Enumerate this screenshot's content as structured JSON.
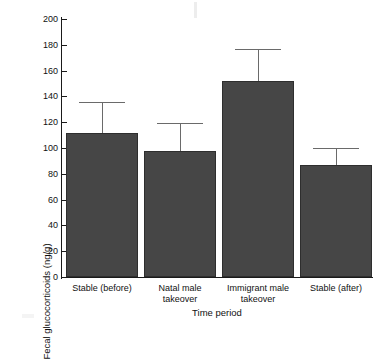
{
  "chart_data": {
    "type": "bar",
    "title": "",
    "xlabel": "Time period",
    "ylabel": "Fecal glucocorticoids (ng/g)",
    "categories": [
      "Stable (before)",
      "Natal male takeover",
      "Immigrant male takeover",
      "Stable (after)"
    ],
    "category_lines": [
      [
        "Stable (before)"
      ],
      [
        "Natal male",
        "takeover"
      ],
      [
        "Immigrant male",
        "takeover"
      ],
      [
        "Stable (after)"
      ]
    ],
    "values": [
      112,
      98,
      152,
      87
    ],
    "error_upper": [
      136,
      119,
      177,
      100
    ],
    "error_bar_magnitude": [
      24,
      21,
      25,
      13
    ],
    "ylim": [
      0,
      200
    ],
    "ytick_labels": [
      "200",
      "180",
      "160",
      "140",
      "120",
      "100",
      "80",
      "60",
      "40",
      "20",
      "0"
    ],
    "ytick_values": [
      200,
      180,
      160,
      140,
      120,
      100,
      80,
      60,
      40,
      20,
      0
    ],
    "ytick_step": 20,
    "grid": false,
    "legend": false,
    "bar_color": "#464646",
    "error_color": "#6a6a6a",
    "axis_color": "#1a1a1a",
    "background": "#ffffff"
  }
}
